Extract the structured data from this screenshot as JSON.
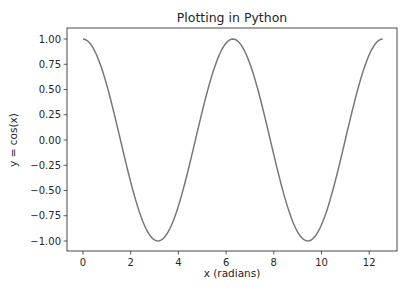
{
  "chart_data": {
    "type": "line",
    "title": "Plotting in Python",
    "xlabel": "x (radians)",
    "ylabel": "y = cos(x)",
    "xlim": [
      -0.63,
      13.2
    ],
    "ylim": [
      -1.1,
      1.1
    ],
    "xticks": [
      0,
      2,
      4,
      6,
      8,
      10,
      12
    ],
    "yticks": [
      1.0,
      0.75,
      0.5,
      0.25,
      0.0,
      -0.25,
      -0.5,
      -0.75,
      -1.0
    ],
    "ytick_labels": [
      "1.00",
      "0.75",
      "0.50",
      "0.25",
      "0.00",
      "−0.25",
      "−0.50",
      "−0.75",
      "−1.00"
    ],
    "xtick_labels": [
      "0",
      "2",
      "4",
      "6",
      "8",
      "10",
      "12"
    ],
    "grid": false,
    "legend": null,
    "series": [
      {
        "name": "cos(x)",
        "function": "cos",
        "x_start": 0,
        "x_end": 12.566,
        "samples": 200,
        "color": "#777777"
      }
    ]
  },
  "layout": {
    "axes_left": 67,
    "axes_top": 28,
    "axes_right": 397,
    "axes_bottom": 251,
    "x0_px": 83,
    "x_per_unit": 23.85,
    "y1_px": 39,
    "ym1_px": 241
  }
}
